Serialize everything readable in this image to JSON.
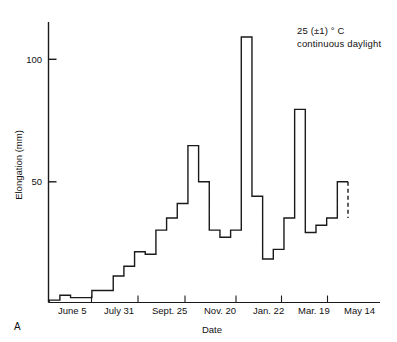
{
  "figure": {
    "panel_label": "A",
    "annotation": {
      "line1": "25 (±1) ° C",
      "line2": "continuous daylight"
    }
  },
  "chart_data": {
    "type": "line",
    "subtype": "step",
    "title": "",
    "subtitle": "",
    "xlabel": "Date",
    "ylabel": "Elongation (mm)",
    "ylim": [
      0,
      118
    ],
    "xlim": [
      0,
      27
    ],
    "grid": false,
    "legend": null,
    "annotations": [
      "25 (±1) ° C",
      "continuous daylight"
    ],
    "ytick_labels": [
      "50",
      "100"
    ],
    "ytick_values": [
      50,
      100
    ],
    "xtick_labels": [
      "June 5",
      "July 31",
      "Sept. 25",
      "Nov. 20",
      "Jan. 22",
      "Mar. 19",
      "May 14"
    ],
    "xtick_values": [
      0,
      4,
      8,
      12,
      16.5,
      20.5,
      24.5
    ],
    "x_index": [
      0,
      1,
      2,
      3,
      4,
      5,
      6,
      7,
      8,
      9,
      10,
      11,
      12,
      13,
      14,
      15,
      16,
      17,
      18,
      19,
      20,
      21,
      22,
      23,
      24,
      25,
      26
    ],
    "values": [
      1,
      3,
      2,
      2,
      5,
      5,
      11,
      15,
      21,
      20,
      30,
      35,
      41,
      65,
      50,
      30,
      27,
      30,
      110,
      44,
      18,
      22,
      35,
      80,
      29,
      32,
      35
    ],
    "final_value": 50,
    "dashed_tail": true,
    "series": [
      {
        "name": "Elongation",
        "values": [
          1,
          3,
          2,
          2,
          5,
          5,
          11,
          15,
          21,
          20,
          30,
          35,
          41,
          65,
          50,
          30,
          27,
          30,
          110,
          44,
          18,
          22,
          35,
          80,
          29,
          32,
          35,
          50
        ]
      }
    ]
  }
}
